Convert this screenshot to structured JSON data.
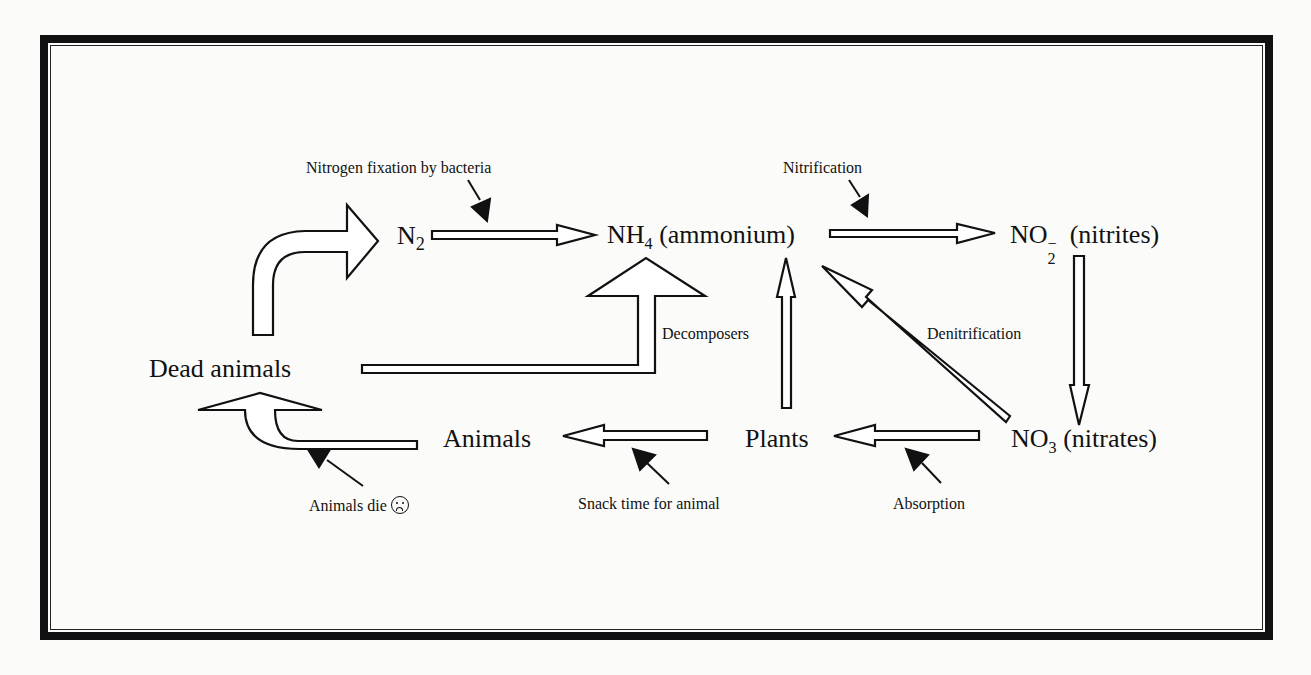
{
  "diagram": {
    "nodes": {
      "n2": {
        "base": "N",
        "sub": "2"
      },
      "nh4": {
        "base": "NH",
        "sub": "4",
        "rest": " (ammonium)"
      },
      "no2": {
        "base": "NO",
        "sub": "2",
        "sup": "−",
        "rest": "  (nitrites)"
      },
      "no3": {
        "base": "NO",
        "sub": "3",
        "rest": " (nitrates)"
      },
      "plants": "Plants",
      "animals": "Animals",
      "dead_animals": "Dead animals"
    },
    "labels": {
      "fixation": "Nitrogen fixation by bacteria",
      "nitrification": "Nitrification",
      "decomposers": "Decomposers",
      "denitrification": "Denitrification",
      "absorption": "Absorption",
      "snack": "Snack time for animal",
      "animals_die": "Animals die"
    },
    "icons": {
      "sad_face": "sad-face-icon"
    },
    "edges": [
      {
        "from": "Dead animals",
        "to": "N2",
        "label": ""
      },
      {
        "from": "N2",
        "to": "NH4 (ammonium)",
        "label": "Nitrogen fixation by bacteria"
      },
      {
        "from": "NH4 (ammonium)",
        "to": "NO2- (nitrites)",
        "label": "Nitrification"
      },
      {
        "from": "NO2- (nitrites)",
        "to": "NO3 (nitrates)",
        "label": ""
      },
      {
        "from": "NO3 (nitrates)",
        "to": "NH4 (ammonium)",
        "label": "Denitrification"
      },
      {
        "from": "NO3 (nitrates)",
        "to": "Plants",
        "label": "Absorption"
      },
      {
        "from": "Plants",
        "to": "NH4 (ammonium)",
        "label": ""
      },
      {
        "from": "Plants",
        "to": "Animals",
        "label": "Snack time for animal"
      },
      {
        "from": "Animals",
        "to": "Dead animals",
        "label": "Animals die"
      },
      {
        "from": "Dead animals",
        "to": "NH4 (ammonium)",
        "label": "Decomposers"
      }
    ],
    "colors": {
      "ink": "#111111",
      "paper": "#fbfbfa"
    }
  }
}
